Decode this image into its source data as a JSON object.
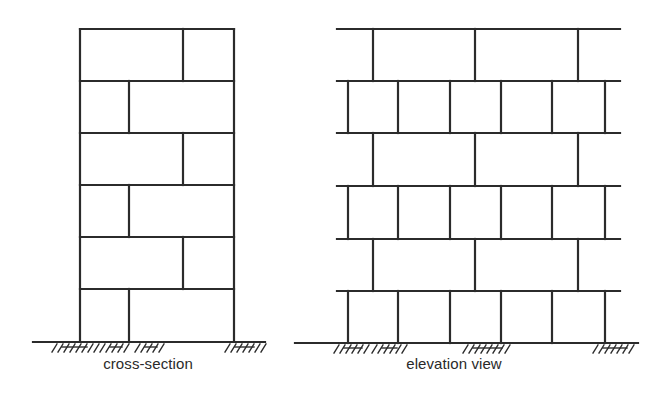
{
  "labels": {
    "cross_section": "cross-section",
    "elevation": "elevation view"
  },
  "style": {
    "line_color": "#2b2b2b",
    "background": "#ffffff"
  },
  "cross_section": {
    "left": 80,
    "right": 234,
    "rows_y": [
      29,
      81,
      133,
      185,
      237,
      289,
      342
    ],
    "joints": [
      183,
      129,
      183,
      129,
      183,
      129
    ],
    "ground": {
      "x1": 33,
      "x2": 265,
      "y": 342
    },
    "hatches": [
      [
        52,
        95
      ],
      [
        100,
        130
      ],
      [
        135,
        165
      ],
      [
        225,
        262
      ]
    ]
  },
  "elevation": {
    "left": 337,
    "right": 620,
    "rows_y": [
      29,
      81,
      133,
      186,
      239,
      291,
      343
    ],
    "long_joints": [
      373,
      475,
      578
    ],
    "short_joints": [
      348,
      398,
      450,
      501,
      552,
      605
    ],
    "ground": {
      "x1": 295,
      "x2": 638,
      "y": 343
    },
    "hatches": [
      [
        334,
        370
      ],
      [
        372,
        405
      ],
      [
        463,
        510
      ],
      [
        593,
        635
      ]
    ]
  }
}
